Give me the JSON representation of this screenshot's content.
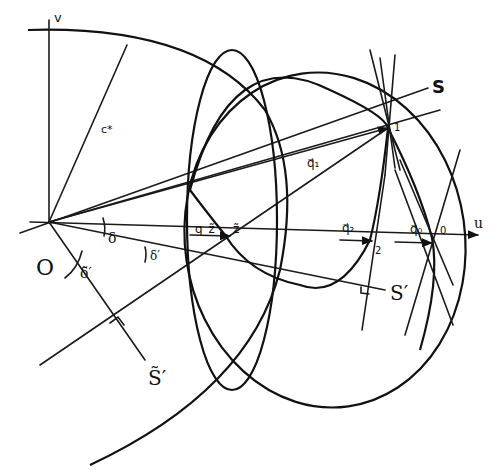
{
  "diagram": {
    "type": "geometric-construction",
    "labels": {
      "origin": "O",
      "axis_u": "u",
      "axis_v": "v",
      "circle_radius": "c*",
      "ray_S": "S",
      "ray_S_prime": "S′",
      "ray_S_tilde_prime": "S̃′",
      "angle_delta": "δ",
      "angle_delta_prime": "δ′",
      "angle_delta_tilde_prime": "δ̃′",
      "vector_q1": "q⃗₁",
      "vector_q2": "q⃗₂",
      "vector_q0": "q⃗₀",
      "vector_q_tilde": "q_z̃",
      "point_tilde": "z̃",
      "point_1": "1",
      "point_2": "2",
      "point_0": "0"
    }
  }
}
